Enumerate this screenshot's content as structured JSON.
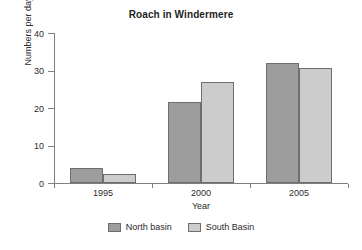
{
  "chart_data": {
    "type": "bar",
    "title": "Roach in Windermere",
    "xlabel": "Year",
    "ylabel": "Numbers per day",
    "categories": [
      "1995",
      "2000",
      "2005"
    ],
    "series": [
      {
        "name": "North basin",
        "color": "#9d9d9d",
        "values": [
          4,
          21.5,
          32
        ]
      },
      {
        "name": "South Basin",
        "color": "#cccccc",
        "values": [
          2.5,
          27,
          30.7
        ]
      }
    ],
    "ylim": [
      0,
      40
    ],
    "yticks": [
      0,
      10,
      20,
      30,
      40
    ],
    "ytick_labels": [
      "0",
      "10",
      "20",
      "30",
      "40"
    ],
    "grid": false,
    "legend_position": "bottom"
  }
}
